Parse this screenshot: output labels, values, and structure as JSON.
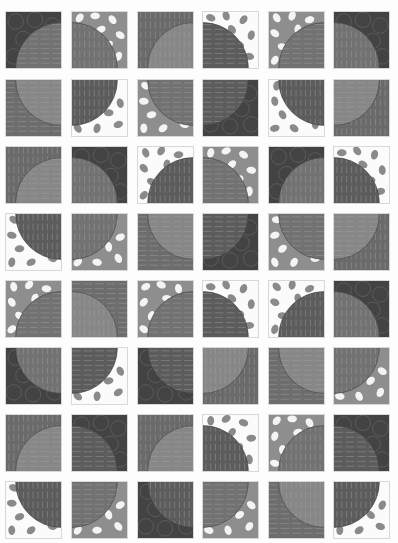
{
  "quilt": {
    "title": "Quarter-circle quilt block layout",
    "layout": {
      "columns": 6,
      "rows": 8,
      "col_x": [
        5,
        71,
        137,
        202,
        268,
        333
      ],
      "row_y": [
        11,
        79,
        146,
        213,
        280,
        347,
        414,
        481
      ],
      "tile_w": 57,
      "tile_h": 58
    },
    "colors": {
      "page_bg": "#fdfdfd",
      "floral_bg": "#434343",
      "floral_line": "#5c5c5c",
      "gray_leaf_bg": "#8e8e8e",
      "gray_leaf_leaf": "#f4f4f4",
      "white_leaf_bg": "#fbfbfb",
      "white_leaf_leaf": "#8a8a8a",
      "vstripe_bg": "#6a6a6a",
      "hstripe_bg": "#6d6d6d",
      "stripe_line": "#a9a9a9",
      "circle_light": "#878787",
      "circle_mid": "#727272",
      "circle_dark": "#5c5c5c"
    },
    "tiles": [
      [
        {
          "bg": "floral",
          "circle": "hstripe",
          "shade": "mid",
          "corner": "br"
        },
        {
          "bg": "gleaf",
          "circle": "vstripe",
          "shade": "mid",
          "corner": "bl"
        },
        {
          "bg": "vstripe",
          "circle": "vstripe",
          "shade": "light",
          "corner": "br"
        },
        {
          "bg": "wleaf",
          "circle": "hstripe",
          "shade": "dark",
          "corner": "bl"
        },
        {
          "bg": "gleaf",
          "circle": "hstripe",
          "shade": "mid",
          "corner": "br"
        },
        {
          "bg": "floral",
          "circle": "vstripe",
          "shade": "mid",
          "corner": "bl"
        }
      ],
      [
        {
          "bg": "hstripe",
          "circle": "hstripe",
          "shade": "light",
          "corner": "tr"
        },
        {
          "bg": "wleaf",
          "circle": "vstripe",
          "shade": "dark",
          "corner": "tl"
        },
        {
          "bg": "gleaf",
          "circle": "hstripe",
          "shade": "mid",
          "corner": "tr"
        },
        {
          "bg": "floral",
          "circle": "hstripe",
          "shade": "dark",
          "corner": "tl"
        },
        {
          "bg": "wleaf",
          "circle": "vstripe",
          "shade": "dark",
          "corner": "tr"
        },
        {
          "bg": "vstripe",
          "circle": "hstripe",
          "shade": "light",
          "corner": "tl"
        }
      ],
      [
        {
          "bg": "vstripe",
          "circle": "hstripe",
          "shade": "light",
          "corner": "br"
        },
        {
          "bg": "floral",
          "circle": "vstripe",
          "shade": "mid",
          "corner": "bl"
        },
        {
          "bg": "wleaf",
          "circle": "vstripe",
          "shade": "dark",
          "corner": "br"
        },
        {
          "bg": "gleaf",
          "circle": "hstripe",
          "shade": "mid",
          "corner": "bl"
        },
        {
          "bg": "floral",
          "circle": "vstripe",
          "shade": "mid",
          "corner": "br"
        },
        {
          "bg": "wleaf",
          "circle": "vstripe",
          "shade": "dark",
          "corner": "bl"
        }
      ],
      [
        {
          "bg": "wleaf",
          "circle": "vstripe",
          "shade": "dark",
          "corner": "tr"
        },
        {
          "bg": "gleaf",
          "circle": "vstripe",
          "shade": "mid",
          "corner": "tl"
        },
        {
          "bg": "hstripe",
          "circle": "hstripe",
          "shade": "light",
          "corner": "tr"
        },
        {
          "bg": "floral",
          "circle": "hstripe",
          "shade": "dark",
          "corner": "tl"
        },
        {
          "bg": "gleaf",
          "circle": "hstripe",
          "shade": "mid",
          "corner": "tr"
        },
        {
          "bg": "vstripe",
          "circle": "hstripe",
          "shade": "light",
          "corner": "tl"
        }
      ],
      [
        {
          "bg": "gleaf",
          "circle": "hstripe",
          "shade": "mid",
          "corner": "br"
        },
        {
          "bg": "hstripe",
          "circle": "vstripe",
          "shade": "light",
          "corner": "bl"
        },
        {
          "bg": "gleaf",
          "circle": "hstripe",
          "shade": "mid",
          "corner": "br"
        },
        {
          "bg": "wleaf",
          "circle": "hstripe",
          "shade": "dark",
          "corner": "bl"
        },
        {
          "bg": "wleaf",
          "circle": "vstripe",
          "shade": "dark",
          "corner": "br"
        },
        {
          "bg": "floral",
          "circle": "vstripe",
          "shade": "mid",
          "corner": "bl"
        }
      ],
      [
        {
          "bg": "floral",
          "circle": "vstripe",
          "shade": "mid",
          "corner": "tr"
        },
        {
          "bg": "wleaf",
          "circle": "hstripe",
          "shade": "dark",
          "corner": "tl"
        },
        {
          "bg": "floral",
          "circle": "hstripe",
          "shade": "dark",
          "corner": "tr"
        },
        {
          "bg": "vstripe",
          "circle": "vstripe",
          "shade": "light",
          "corner": "tl"
        },
        {
          "bg": "hstripe",
          "circle": "hstripe",
          "shade": "light",
          "corner": "tr"
        },
        {
          "bg": "gleaf",
          "circle": "vstripe",
          "shade": "mid",
          "corner": "tl"
        }
      ],
      [
        {
          "bg": "vstripe",
          "circle": "hstripe",
          "shade": "light",
          "corner": "br"
        },
        {
          "bg": "floral",
          "circle": "hstripe",
          "shade": "dark",
          "corner": "bl"
        },
        {
          "bg": "vstripe",
          "circle": "hstripe",
          "shade": "light",
          "corner": "br"
        },
        {
          "bg": "wleaf",
          "circle": "vstripe",
          "shade": "dark",
          "corner": "bl"
        },
        {
          "bg": "gleaf",
          "circle": "vstripe",
          "shade": "mid",
          "corner": "br"
        },
        {
          "bg": "floral",
          "circle": "hstripe",
          "shade": "dark",
          "corner": "bl"
        }
      ],
      [
        {
          "bg": "wleaf",
          "circle": "vstripe",
          "shade": "dark",
          "corner": "tr"
        },
        {
          "bg": "gleaf",
          "circle": "hstripe",
          "shade": "mid",
          "corner": "tl"
        },
        {
          "bg": "floral",
          "circle": "vstripe",
          "shade": "dark",
          "corner": "tr"
        },
        {
          "bg": "gleaf",
          "circle": "hstripe",
          "shade": "mid",
          "corner": "tl"
        },
        {
          "bg": "hstripe",
          "circle": "vstripe",
          "shade": "light",
          "corner": "tr"
        },
        {
          "bg": "wleaf",
          "circle": "vstripe",
          "shade": "dark",
          "corner": "tl"
        }
      ]
    ]
  }
}
